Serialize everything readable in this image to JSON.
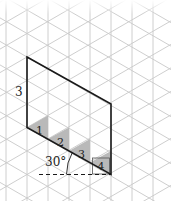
{
  "figure": {
    "colors": {
      "grid": "#c8c8c8",
      "outline": "#1a1a1a",
      "shade": "#b8b8b8",
      "background": "#ffffff"
    },
    "side_label": "3",
    "angle_label": "30°",
    "triangle_labels": [
      "1",
      "2",
      "3",
      "4"
    ]
  }
}
